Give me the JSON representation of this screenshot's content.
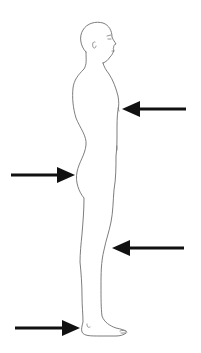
{
  "diagram": {
    "colors": {
      "background": "#ffffff",
      "outline": "#6e6e6e",
      "arrow": "#111111"
    },
    "arrows": [
      {
        "id": "chest",
        "target": "chest",
        "direction": "left"
      },
      {
        "id": "buttocks",
        "target": "buttocks",
        "direction": "right"
      },
      {
        "id": "calf",
        "target": "calf",
        "direction": "left"
      },
      {
        "id": "heel",
        "target": "heel",
        "direction": "right"
      }
    ]
  }
}
